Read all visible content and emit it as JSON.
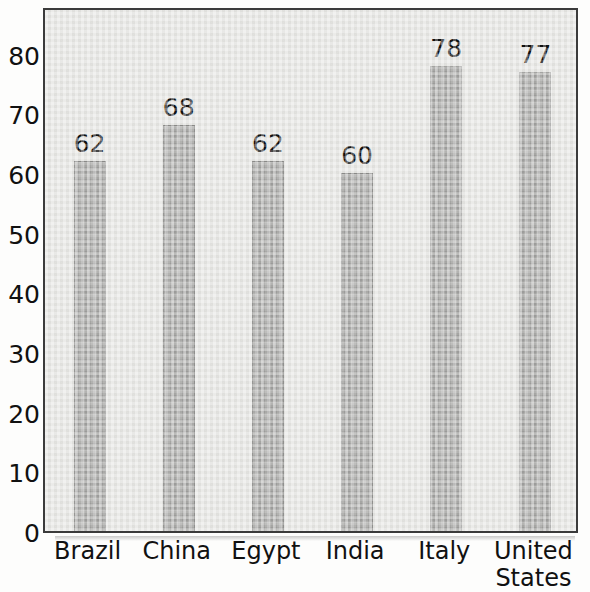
{
  "chart_data": {
    "type": "bar",
    "title": "",
    "subtitle": "",
    "xlabel": "",
    "ylabel": "",
    "categories": [
      "Brazil",
      "China",
      "Egypt",
      "India",
      "Italy",
      "United States"
    ],
    "values": [
      62,
      68,
      62,
      60,
      78,
      77
    ],
    "data_labels": [
      "62",
      "68",
      "62",
      "60",
      "78",
      "77"
    ],
    "ylim": [
      0,
      88
    ],
    "yticks": [
      0,
      10,
      20,
      30,
      40,
      50,
      60,
      70,
      80
    ],
    "ytick_labels": [
      "0",
      "10",
      "20",
      "30",
      "40",
      "50",
      "60",
      "70",
      "80"
    ],
    "grid": false,
    "legend": null,
    "legend_position": "none",
    "colors": {
      "bar_fill": "#a9a9a7",
      "bar_edge": "#8d8d8b",
      "plot_background": "#e6e6e3",
      "frame_border": "#3b3b3b",
      "text": "#111111",
      "figure_background": "#fdfdfc"
    }
  }
}
